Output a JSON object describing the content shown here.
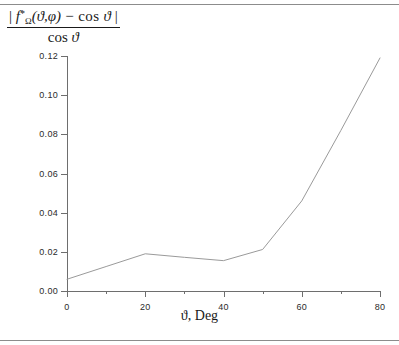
{
  "figure": {
    "ylabel": {
      "numerator_pre": "| ",
      "numerator_f": "f",
      "numerator_star": "*",
      "numerator_sub": "Ω",
      "numerator_args": "(ϑ,φ)",
      "numerator_minus": " − cos ",
      "numerator_theta": "ϑ",
      "numerator_post": " |",
      "denominator_cos": "cos ",
      "denominator_theta": "ϑ"
    },
    "xlabel": "ϑ, Deg",
    "line_color": "#9a9a9a",
    "axis_color": "#6e6e6e"
  },
  "chart_data": {
    "type": "line",
    "title": "",
    "xlabel": "ϑ, Deg",
    "ylabel": "| f*_Ω(ϑ,φ) − cos ϑ | / cos ϑ",
    "xlim": [
      0,
      80
    ],
    "ylim": [
      0.0,
      0.12
    ],
    "grid": false,
    "legend": "none",
    "xticks": [
      0,
      20,
      40,
      60,
      80
    ],
    "xtick_labels": [
      "0",
      "20",
      "40",
      "60",
      "80"
    ],
    "xticks_minor": [
      10,
      30,
      50,
      70
    ],
    "yticks": [
      0.0,
      0.02,
      0.04,
      0.06,
      0.08,
      0.1,
      0.12
    ],
    "ytick_labels": [
      "0.00",
      "0.02",
      "0.04",
      "0.06",
      "0.08",
      "0.10",
      "0.12"
    ],
    "x": [
      0,
      10,
      20,
      30,
      40,
      50,
      60,
      70,
      80
    ],
    "values": [
      0.006,
      0.0125,
      0.019,
      0.0172,
      0.0155,
      0.0212,
      0.046,
      0.082,
      0.119
    ],
    "series": [
      {
        "name": "relative error",
        "values": [
          0.006,
          0.0125,
          0.019,
          0.0172,
          0.0155,
          0.0212,
          0.046,
          0.082,
          0.119
        ]
      }
    ]
  }
}
